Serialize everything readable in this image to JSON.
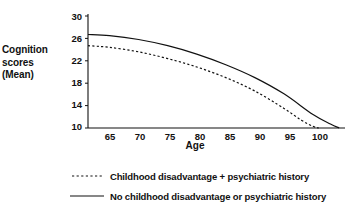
{
  "chart_data": {
    "type": "line",
    "title": "",
    "xlabel": "Age",
    "ylabel": "Cognition scores (Mean)",
    "ylabel_lines": [
      "Cognition",
      "scores",
      "(Mean)"
    ],
    "xlim": [
      61.3,
      105.5
    ],
    "ylim": [
      10,
      30
    ],
    "xticks": [
      65,
      70,
      75,
      80,
      85,
      90,
      95,
      100
    ],
    "yticks": [
      30,
      26,
      22,
      18,
      14,
      10
    ],
    "grid": false,
    "legend_position": "below",
    "series": [
      {
        "name": "Childhood disadvantage + psychiatric history",
        "style": "dashed",
        "color": "#111111",
        "x": [
          61.3,
          65,
          70,
          75,
          80,
          85,
          90,
          95,
          98,
          100,
          101
        ],
        "values": [
          24.7,
          24.4,
          23.6,
          22.4,
          20.9,
          19.0,
          16.6,
          13.5,
          11.4,
          10.3,
          10.0
        ]
      },
      {
        "name": "No childhood disadvantage or psychiatric history",
        "style": "solid",
        "color": "#111111",
        "x": [
          61.3,
          65,
          70,
          75,
          80,
          85,
          90,
          95,
          100,
          103,
          104.5
        ],
        "values": [
          26.7,
          26.5,
          25.8,
          24.7,
          23.2,
          21.3,
          19.0,
          16.1,
          12.4,
          10.7,
          10.0
        ]
      }
    ]
  },
  "legend": {
    "items": [
      {
        "label": "Childhood disadvantage + psychiatric history",
        "style": "dashed"
      },
      {
        "label": "No childhood disadvantage or psychiatric history",
        "style": "solid"
      }
    ]
  },
  "axis": {
    "x_title": "Age",
    "y_title_line1": "Cognition",
    "y_title_line2": "scores",
    "y_title_line3": "(Mean)",
    "yticks": [
      "30",
      "26",
      "22",
      "18",
      "14",
      "10"
    ],
    "xticks": [
      "65",
      "70",
      "75",
      "80",
      "85",
      "90",
      "95",
      "100"
    ]
  },
  "colors": {
    "line": "#111111",
    "axis": "#111111",
    "background": "#ffffff"
  }
}
